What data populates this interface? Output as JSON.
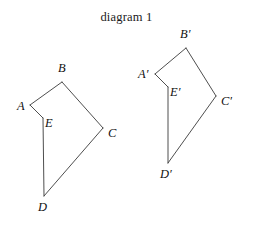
{
  "title": "diagram 1",
  "canvas": {
    "width": 253,
    "height": 231,
    "background": "#ffffff"
  },
  "style": {
    "stroke_color": "#3a3a3a",
    "stroke_width": 0.9,
    "label_color": "#111111",
    "title_color": "#1a1a1a"
  },
  "figures": [
    {
      "name": "preimage-polygon",
      "label": "ABCDE",
      "closed": true,
      "vertices": [
        {
          "id": "A",
          "label": "A",
          "x": 30,
          "y": 105
        },
        {
          "id": "B",
          "label": "B",
          "x": 62,
          "y": 82
        },
        {
          "id": "C",
          "label": "C",
          "x": 103,
          "y": 128
        },
        {
          "id": "D",
          "label": "D",
          "x": 44,
          "y": 196
        },
        {
          "id": "E",
          "label": "E",
          "x": 43,
          "y": 118
        }
      ],
      "edges": [
        {
          "from": "A",
          "to": "B"
        },
        {
          "from": "B",
          "to": "C"
        },
        {
          "from": "C",
          "to": "D"
        },
        {
          "from": "D",
          "to": "E"
        },
        {
          "from": "E",
          "to": "A"
        }
      ],
      "labels": [
        {
          "id": "A",
          "text": "A",
          "x": 17,
          "y": 100
        },
        {
          "id": "B",
          "text": "B",
          "x": 58,
          "y": 62
        },
        {
          "id": "C",
          "text": "C",
          "x": 108,
          "y": 127
        },
        {
          "id": "D",
          "text": "D",
          "x": 38,
          "y": 201
        },
        {
          "id": "E",
          "text": "E",
          "x": 45,
          "y": 117
        }
      ]
    },
    {
      "name": "image-polygon",
      "label": "A'B'C'D'E'",
      "closed": true,
      "vertices": [
        {
          "id": "Ap",
          "label": "A'",
          "x": 155,
          "y": 74
        },
        {
          "id": "Bp",
          "label": "B'",
          "x": 186,
          "y": 48
        },
        {
          "id": "Cp",
          "label": "C'",
          "x": 216,
          "y": 96
        },
        {
          "id": "Dp",
          "label": "D'",
          "x": 168,
          "y": 163
        },
        {
          "id": "Ep",
          "label": "E'",
          "x": 168,
          "y": 87
        }
      ],
      "edges": [
        {
          "from": "Ap",
          "to": "Bp"
        },
        {
          "from": "Bp",
          "to": "Cp"
        },
        {
          "from": "Cp",
          "to": "Dp"
        },
        {
          "from": "Dp",
          "to": "Ep"
        },
        {
          "from": "Ep",
          "to": "Ap"
        }
      ],
      "labels": [
        {
          "id": "Ap",
          "text": "A′",
          "x": 138,
          "y": 68
        },
        {
          "id": "Bp",
          "text": "B′",
          "x": 180,
          "y": 28
        },
        {
          "id": "Cp",
          "text": "C′",
          "x": 221,
          "y": 95
        },
        {
          "id": "Dp",
          "text": "D′",
          "x": 160,
          "y": 168
        },
        {
          "id": "Ep",
          "text": "E′",
          "x": 170,
          "y": 86
        }
      ]
    }
  ]
}
